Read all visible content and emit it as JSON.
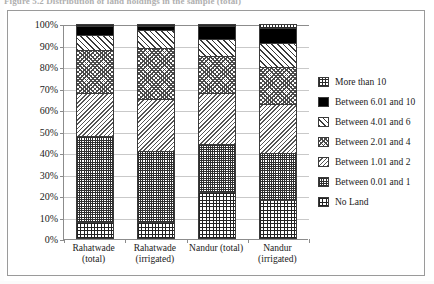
{
  "figure": {
    "caption": "Figure 5.2   Distribution of land holdings in the sample (total)"
  },
  "chart_data": {
    "type": "bar",
    "subtype": "stacked-100-percent",
    "title": "",
    "xlabel": "",
    "ylabel": "",
    "ylim": [
      0,
      100
    ],
    "ytick_labels": [
      "0%",
      "10%",
      "20%",
      "30%",
      "40%",
      "50%",
      "60%",
      "70%",
      "80%",
      "90%",
      "100%"
    ],
    "ytick_values": [
      0,
      10,
      20,
      30,
      40,
      50,
      60,
      70,
      80,
      90,
      100
    ],
    "grid": true,
    "legend_position": "right",
    "categories": [
      "Rahatwade (total)",
      "Rahatwade (irrigated)",
      "Nandur (total)",
      "Nandur (irrigated)"
    ],
    "category_lines": [
      [
        "Rahatwade",
        "(total)"
      ],
      [
        "Rahatwade",
        "(irrigated)"
      ],
      [
        "Nandur (total)",
        ""
      ],
      [
        "Nandur",
        "(irrigated)"
      ]
    ],
    "series": [
      {
        "name": "No Land",
        "values": [
          8,
          8,
          22,
          18
        ]
      },
      {
        "name": "Between 0.01 and 1",
        "values": [
          40,
          33,
          22,
          22
        ]
      },
      {
        "name": "Between 1.01 and 2",
        "values": [
          20,
          24,
          24,
          23
        ]
      },
      {
        "name": "Between 2.01 and 4",
        "values": [
          20,
          24,
          17,
          17
        ]
      },
      {
        "name": "Between 4.01 and 6",
        "values": [
          7,
          8,
          8,
          11
        ]
      },
      {
        "name": "Between 6.01 and 10",
        "values": [
          4,
          2,
          6,
          7
        ]
      },
      {
        "name": "More than 10",
        "values": [
          1,
          1,
          1,
          2
        ]
      }
    ]
  },
  "legend": {
    "items": [
      {
        "label": "More than 10",
        "pattern": "p-morethan10"
      },
      {
        "label": "Between 6.01 and 10",
        "pattern": "p-6to10"
      },
      {
        "label": "Between 4.01 and 6",
        "pattern": "p-4to6"
      },
      {
        "label": "Between 2.01 and 4",
        "pattern": "p-2to4"
      },
      {
        "label": "Between 1.01 and 2",
        "pattern": "p-1to2"
      },
      {
        "label": "Between 0.01 and 1",
        "pattern": "p-0to1"
      },
      {
        "label": "No Land",
        "pattern": "p-noland"
      }
    ]
  }
}
